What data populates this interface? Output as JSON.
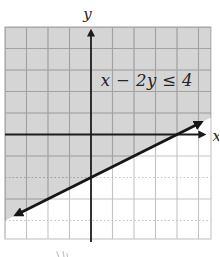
{
  "colors": {
    "background": "#ffffff",
    "shade": "#d5d5d5",
    "grid_light": "#c4c4c4",
    "grid_dark": "#a2a2a2",
    "axis": "#1c1c1c",
    "line": "#161616",
    "text": "#242424",
    "fragment": "#a8a8a8"
  },
  "chart_data": {
    "type": "line",
    "title": "",
    "xlabel": "x",
    "ylabel": "y",
    "xlim": [
      -4,
      5.58
    ],
    "ylim": [
      -4.86,
      5
    ],
    "grid": true,
    "grid_step": 1,
    "grid_x_lines": [
      -4,
      -3,
      -2,
      -1,
      1,
      2,
      3,
      4,
      5
    ],
    "grid_y_lines": [
      5,
      4,
      3,
      2,
      1,
      -1,
      -2,
      -3,
      -4
    ],
    "grid_y_dashed": [
      -2,
      -4
    ],
    "annotation": {
      "text": "x − 2y ≤ 4",
      "position": [
        2.6,
        2.55
      ]
    },
    "boundary_line": {
      "equation": "x − 2y = 4",
      "slope": 0.5,
      "y_intercept": -2,
      "x_intercept": 4,
      "style": "solid",
      "arrows": "both-ends",
      "segment": [
        [
          -3.49,
          -3.745
        ],
        [
          5.12,
          0.56
        ]
      ]
    },
    "shaded_region": "points on or above the boundary line (solutions of x − 2y ≤ 4)",
    "shade_polygon": [
      [
        -4,
        5
      ],
      [
        5.58,
        5
      ],
      [
        5.58,
        0.79
      ],
      [
        -4,
        -4
      ]
    ]
  }
}
